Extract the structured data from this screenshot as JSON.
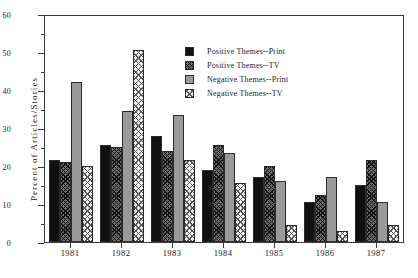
{
  "chart_data": {
    "type": "bar",
    "title": "",
    "xlabel": "",
    "ylabel": "Percent of Articles/Stories",
    "categories": [
      "1981",
      "1982",
      "1983",
      "1984",
      "1985",
      "1986",
      "1987"
    ],
    "ylim": [
      0,
      60
    ],
    "yticks": [
      0,
      10,
      20,
      30,
      40,
      50,
      60
    ],
    "ytick_labels": [
      "0",
      "10",
      "20",
      "30",
      "40",
      "50",
      "60"
    ],
    "yminor_ticks": [
      5,
      15,
      25,
      35,
      45,
      55
    ],
    "grid": false,
    "legend_position": "upper center",
    "series": [
      {
        "name": "Positive Themes--Print",
        "color": "#111111",
        "pattern": "solid-black",
        "values": [
          21.5,
          25.5,
          28.0,
          19.0,
          17.0,
          10.5,
          15.0
        ]
      },
      {
        "name": "Positive Themes--TV",
        "color": "#6f6f6f",
        "pattern": "dark-crosshatch",
        "values": [
          21.0,
          25.0,
          24.0,
          25.5,
          20.0,
          12.5,
          21.5
        ]
      },
      {
        "name": "Negative Themes--Print",
        "color": "#9a9a9a",
        "pattern": "solid-gray",
        "values": [
          42.0,
          34.5,
          33.5,
          23.5,
          16.0,
          17.0,
          10.5
        ]
      },
      {
        "name": "Negative Themes--TV",
        "color": "#f2f2f2",
        "pattern": "light-crosshatch",
        "values": [
          20.0,
          50.5,
          21.5,
          15.5,
          4.5,
          3.0,
          4.5
        ]
      }
    ]
  },
  "legend": {
    "items": [
      {
        "label": "Positive Themes--Print"
      },
      {
        "label": "Positive Themes--TV"
      },
      {
        "label": "Negative Themes--Print"
      },
      {
        "label": "Negative Themes--TV"
      }
    ]
  }
}
